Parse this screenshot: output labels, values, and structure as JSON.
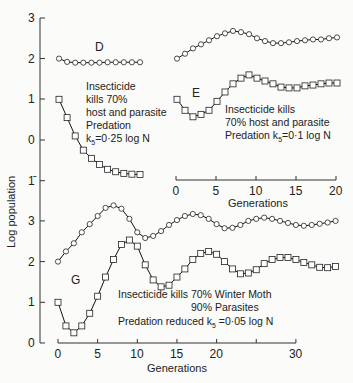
{
  "chart_data": [
    {
      "type": "line",
      "panel": "D",
      "label": "D",
      "annotation": [
        "Insecticide",
        "kills 70%",
        "host and parasite",
        "Predation",
        "k5=0·25 log N"
      ],
      "x": [
        0,
        1,
        2,
        3,
        4,
        5,
        6,
        7,
        8,
        9,
        10
      ],
      "series": [
        {
          "name": "host (circles)",
          "marker": "circle",
          "values": [
            2.0,
            1.92,
            1.9,
            1.9,
            1.9,
            1.9,
            1.91,
            1.91,
            1.91,
            1.91,
            1.91
          ]
        },
        {
          "name": "parasite (squares)",
          "marker": "square",
          "values": [
            1.0,
            0.55,
            0.1,
            -0.25,
            -0.45,
            -0.6,
            -0.72,
            -0.78,
            -0.82,
            -0.84,
            -0.85
          ]
        }
      ],
      "ylabel": "Log population",
      "yticks": [
        "3",
        "2",
        "1",
        "0",
        "1̄"
      ]
    },
    {
      "type": "line",
      "panel": "E",
      "label": "E",
      "annotation": [
        "Insecticide kills",
        "70% host and parasite",
        "Predation k5=0·1 log N"
      ],
      "x": [
        0,
        1,
        2,
        3,
        4,
        5,
        6,
        7,
        8,
        9,
        10,
        11,
        12,
        13,
        14,
        15,
        16,
        17,
        18,
        19,
        20
      ],
      "series": [
        {
          "name": "host (circles)",
          "marker": "circle",
          "values": [
            2.0,
            2.12,
            2.25,
            2.35,
            2.45,
            2.55,
            2.62,
            2.68,
            2.65,
            2.6,
            2.5,
            2.43,
            2.38,
            2.38,
            2.4,
            2.43,
            2.45,
            2.47,
            2.47,
            2.5,
            2.52
          ]
        },
        {
          "name": "parasite (squares)",
          "marker": "square",
          "values": [
            1.0,
            0.73,
            0.57,
            0.63,
            0.73,
            0.95,
            1.18,
            1.38,
            1.52,
            1.6,
            1.52,
            1.45,
            1.38,
            1.3,
            1.28,
            1.28,
            1.33,
            1.35,
            1.38,
            1.4,
            1.4
          ]
        }
      ],
      "xlabel": "Generations",
      "xticks": [
        "0",
        "5",
        "10",
        "15",
        "20"
      ],
      "xlim": [
        0,
        20
      ]
    },
    {
      "type": "line",
      "panel": "G",
      "label": "G",
      "annotation": [
        "Insecticide kills 70% Winter Moth",
        "90% Parasites",
        "Predation reduced k5=0·05 log N"
      ],
      "x": [
        0,
        1,
        2,
        3,
        4,
        5,
        6,
        7,
        8,
        9,
        10,
        11,
        12,
        13,
        14,
        15,
        16,
        17,
        18,
        19,
        20,
        21,
        22,
        23,
        24,
        25,
        26,
        27,
        28,
        29,
        30,
        31,
        32,
        33,
        34,
        35
      ],
      "series": [
        {
          "name": "host (circles)",
          "marker": "circle",
          "values": [
            2.0,
            2.25,
            2.45,
            2.72,
            2.92,
            3.12,
            3.32,
            3.38,
            3.3,
            3.05,
            2.72,
            2.58,
            2.63,
            2.75,
            2.9,
            3.02,
            3.12,
            3.17,
            3.14,
            3.05,
            2.92,
            2.82,
            2.83,
            2.9,
            3.0,
            3.05,
            3.08,
            3.05,
            3.0,
            2.95,
            2.9,
            2.88,
            2.9,
            2.93,
            2.96,
            3.0
          ]
        },
        {
          "name": "parasite (squares)",
          "marker": "square",
          "values": [
            1.0,
            0.42,
            0.25,
            0.42,
            0.73,
            1.15,
            1.62,
            2.05,
            2.42,
            2.53,
            2.38,
            1.92,
            1.55,
            1.38,
            1.42,
            1.62,
            1.82,
            2.05,
            2.2,
            2.25,
            2.18,
            2.0,
            1.82,
            1.7,
            1.72,
            1.8,
            1.95,
            2.05,
            2.1,
            2.1,
            2.05,
            1.98,
            1.92,
            1.86,
            1.85,
            1.88
          ]
        }
      ],
      "xlabel": "Generations",
      "xticks": [
        "0",
        "5",
        "10",
        "15",
        "20",
        "",
        "30"
      ],
      "xlim": [
        0,
        30
      ],
      "yticks": [
        "3",
        "2",
        "1",
        "0"
      ]
    }
  ],
  "texts": {
    "ylabel": "Log population",
    "label_D": "D",
    "label_E": "E",
    "label_G": "G",
    "annD": [
      "Insecticide",
      "kills 70%",
      "host and parasite",
      "Predation",
      "k",
      "5",
      "=0·25 log N"
    ],
    "annE": [
      "Insecticide kills",
      "70% host and parasite",
      "Predation k",
      "5",
      "=0·1 log N"
    ],
    "annG": [
      "Insecticide kills 70% Winter Moth",
      "90% Parasites",
      "Predation reduced  k",
      "5",
      " =0·05  log N"
    ],
    "xlabelE": "Generations",
    "xlabelG": "Generations"
  }
}
